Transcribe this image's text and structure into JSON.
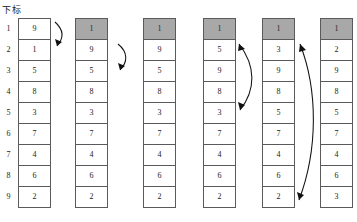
{
  "header": {
    "label": "下标"
  },
  "index_column": {
    "name": "index-column",
    "values": [
      "1",
      "2",
      "3",
      "4",
      "5",
      "6",
      "7",
      "8",
      "9"
    ]
  },
  "colors": {
    "shaded_cell": "#a8a8a8",
    "cell_border": "#5a5a5a",
    "cell_background": "#ffffff",
    "arrow": "#111111",
    "text": "#1a1a1a",
    "page_background": "#ffffff"
  },
  "geometry": {
    "row_height": 21,
    "row_count": 9,
    "cell_width": 33,
    "grid_top": 18,
    "column_x": [
      18,
      75,
      143,
      203,
      262,
      320
    ]
  },
  "columns": [
    {
      "id": "column-1",
      "x": 18,
      "shaded_top": false,
      "values": [
        "9",
        "1",
        "5",
        "8",
        "3",
        "7",
        "4",
        "6",
        "2"
      ]
    },
    {
      "id": "column-2",
      "x": 75,
      "shaded_top": true,
      "values": [
        "1",
        "9",
        "5",
        "8",
        "3",
        "7",
        "4",
        "6",
        "2"
      ]
    },
    {
      "id": "column-3",
      "x": 143,
      "shaded_top": true,
      "values": [
        "1",
        "9",
        "5",
        "8",
        "3",
        "7",
        "4",
        "6",
        "2"
      ]
    },
    {
      "id": "column-4",
      "x": 203,
      "shaded_top": true,
      "values": [
        "1",
        "5",
        "9",
        "8",
        "3",
        "7",
        "4",
        "6",
        "2"
      ]
    },
    {
      "id": "column-5",
      "x": 262,
      "shaded_top": true,
      "values": [
        "1",
        "3",
        "9",
        "8",
        "5",
        "7",
        "4",
        "6",
        "2"
      ]
    },
    {
      "id": "column-6",
      "x": 320,
      "shaded_top": true,
      "values": [
        "1",
        "2",
        "9",
        "8",
        "5",
        "7",
        "4",
        "6",
        "3"
      ]
    }
  ],
  "arrows": [
    {
      "id": "arrow-1",
      "name": "swap-arrow-row1-to-row2",
      "from_row": 1,
      "to_row": 2,
      "direction": "down",
      "double_headed": false,
      "path": "M 55 22 C 64 30, 64 38, 57 46",
      "heads": [
        {
          "points": "57,46 55,39 62,42"
        }
      ]
    },
    {
      "id": "arrow-2",
      "name": "swap-arrow-row2-to-row3",
      "from_row": 2,
      "to_row": 3,
      "direction": "down",
      "double_headed": false,
      "path": "M 118 44 C 128 52, 128 62, 120 70",
      "heads": [
        {
          "points": "120,70 118,63 125,66"
        }
      ]
    },
    {
      "id": "arrow-3",
      "name": "swap-arrow-row2-to-row5",
      "from_row": 2,
      "to_row": 5,
      "direction": "down",
      "double_headed": true,
      "path": "M 239 44 C 256 66, 256 90, 240 110",
      "heads": [
        {
          "points": "239,44 245,49 238,51"
        },
        {
          "points": "240,110 238,102 245,105"
        }
      ]
    },
    {
      "id": "arrow-4",
      "name": "swap-arrow-row2-to-row9",
      "from_row": 2,
      "to_row": 9,
      "direction": "up",
      "double_headed": true,
      "path": "M 300 44 C 318 90, 318 150, 299 200",
      "heads": [
        {
          "points": "300,44 306,50 299,52"
        },
        {
          "points": "299,200 297,192 304,195"
        }
      ]
    }
  ]
}
